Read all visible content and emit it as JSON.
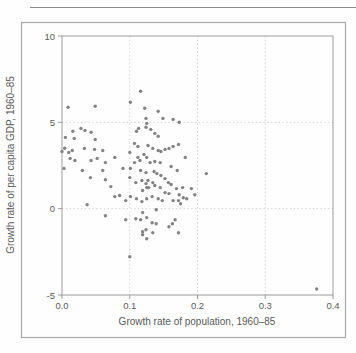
{
  "figure": {
    "background": "#fefefe",
    "box_border_color": "#a8a8a8",
    "top_rule_color": "#8c8c8c"
  },
  "chart_data": {
    "type": "scatter",
    "title": "",
    "xlabel": "Growth rate of population, 1960–85",
    "ylabel": "Growth rate of per capita GDP, 1960–85",
    "xlim": [
      0.0,
      0.4
    ],
    "ylim": [
      -5,
      10
    ],
    "grid": "dotted",
    "legend": "none",
    "x_ticks": [
      {
        "value": 0.0,
        "label": "0.0"
      },
      {
        "value": 0.1,
        "label": "0.1"
      },
      {
        "value": 0.2,
        "label": "0.2"
      },
      {
        "value": 0.3,
        "label": "0.3"
      },
      {
        "value": 0.4,
        "label": "0.4"
      }
    ],
    "y_ticks": [
      {
        "value": 10,
        "label": "10"
      },
      {
        "value": 5,
        "label": "5"
      },
      {
        "value": 0,
        "label": "0"
      },
      {
        "value": -5,
        "label": "-5"
      }
    ],
    "x_gridlines": [
      0.1,
      0.2,
      0.3
    ],
    "y_gridlines": [
      0,
      5
    ],
    "point_color": "#838383",
    "point_radius": 1.7,
    "frame_color": "#9b9b9b",
    "gridline_color": "#cbcbcb",
    "points": [
      [
        0.009,
        5.87
      ],
      [
        0.049,
        5.93
      ],
      [
        0.101,
        6.16
      ],
      [
        0.116,
        6.8
      ],
      [
        0.122,
        5.81
      ],
      [
        0.142,
        5.64
      ],
      [
        0.164,
        5.17
      ],
      [
        0.173,
        5.0
      ],
      [
        0.124,
        5.23
      ],
      [
        0.149,
        5.23
      ],
      [
        0.016,
        4.48
      ],
      [
        0.028,
        4.65
      ],
      [
        0.034,
        4.53
      ],
      [
        0.043,
        4.42
      ],
      [
        0.005,
        4.13
      ],
      [
        0.018,
        4.07
      ],
      [
        0.049,
        4.01
      ],
      [
        0.11,
        4.48
      ],
      [
        0.113,
        4.65
      ],
      [
        0.124,
        4.71
      ],
      [
        0.131,
        4.59
      ],
      [
        0.137,
        4.36
      ],
      [
        0.142,
        4.19
      ],
      [
        0.125,
        4.94
      ],
      [
        0.004,
        3.5
      ],
      [
        0.0,
        3.31
      ],
      [
        0.01,
        3.26
      ],
      [
        0.015,
        3.37
      ],
      [
        0.033,
        3.49
      ],
      [
        0.048,
        3.43
      ],
      [
        0.06,
        3.37
      ],
      [
        0.107,
        3.78
      ],
      [
        0.112,
        3.6
      ],
      [
        0.127,
        3.66
      ],
      [
        0.134,
        3.49
      ],
      [
        0.142,
        3.37
      ],
      [
        0.146,
        3.31
      ],
      [
        0.152,
        3.43
      ],
      [
        0.158,
        3.49
      ],
      [
        0.164,
        3.6
      ],
      [
        0.172,
        3.72
      ],
      [
        0.1,
        3.26
      ],
      [
        0.121,
        3.14
      ],
      [
        0.012,
        2.91
      ],
      [
        0.019,
        2.79
      ],
      [
        0.043,
        2.79
      ],
      [
        0.052,
        2.91
      ],
      [
        0.064,
        2.67
      ],
      [
        0.078,
        2.97
      ],
      [
        0.112,
        2.97
      ],
      [
        0.125,
        2.97
      ],
      [
        0.115,
        2.79
      ],
      [
        0.107,
        2.67
      ],
      [
        0.13,
        2.67
      ],
      [
        0.137,
        2.73
      ],
      [
        0.145,
        2.67
      ],
      [
        0.182,
        2.97
      ],
      [
        0.003,
        2.33
      ],
      [
        0.03,
        2.21
      ],
      [
        0.06,
        2.21
      ],
      [
        0.09,
        2.33
      ],
      [
        0.101,
        2.33
      ],
      [
        0.116,
        2.21
      ],
      [
        0.124,
        2.09
      ],
      [
        0.136,
        2.15
      ],
      [
        0.14,
        2.03
      ],
      [
        0.161,
        2.44
      ],
      [
        0.17,
        2.21
      ],
      [
        0.213,
        2.03
      ],
      [
        0.042,
        1.8
      ],
      [
        0.1,
        1.8
      ],
      [
        0.064,
        1.68
      ],
      [
        0.146,
        1.92
      ],
      [
        0.152,
        1.74
      ],
      [
        0.127,
        1.63
      ],
      [
        0.134,
        1.51
      ],
      [
        0.072,
        1.28
      ],
      [
        0.109,
        1.51
      ],
      [
        0.118,
        1.63
      ],
      [
        0.124,
        1.45
      ],
      [
        0.128,
        1.22
      ],
      [
        0.137,
        1.34
      ],
      [
        0.145,
        1.22
      ],
      [
        0.157,
        1.51
      ],
      [
        0.161,
        1.4
      ],
      [
        0.169,
        1.16
      ],
      [
        0.178,
        1.22
      ],
      [
        0.191,
        1.16
      ],
      [
        0.119,
        1.05
      ],
      [
        0.125,
        1.22
      ],
      [
        0.037,
        0.23
      ],
      [
        0.078,
        0.7
      ],
      [
        0.085,
        0.76
      ],
      [
        0.094,
        0.47
      ],
      [
        0.101,
        0.7
      ],
      [
        0.11,
        0.58
      ],
      [
        0.118,
        0.41
      ],
      [
        0.125,
        0.58
      ],
      [
        0.152,
        0.93
      ],
      [
        0.158,
        0.87
      ],
      [
        0.133,
        0.7
      ],
      [
        0.142,
        0.58
      ],
      [
        0.148,
        0.47
      ],
      [
        0.164,
        0.47
      ],
      [
        0.172,
        0.47
      ],
      [
        0.179,
        0.63
      ],
      [
        0.184,
        0.58
      ],
      [
        0.196,
        0.81
      ],
      [
        0.173,
        0.81
      ],
      [
        0.175,
        0.29
      ],
      [
        0.139,
        -0.06
      ],
      [
        0.119,
        -0.23
      ],
      [
        0.064,
        -0.41
      ],
      [
        0.094,
        -0.64
      ],
      [
        0.109,
        -0.58
      ],
      [
        0.116,
        -0.64
      ],
      [
        0.125,
        -0.52
      ],
      [
        0.167,
        -0.64
      ],
      [
        0.133,
        -0.81
      ],
      [
        0.139,
        -0.87
      ],
      [
        0.163,
        -0.87
      ],
      [
        0.158,
        -1.05
      ],
      [
        0.124,
        -1.22
      ],
      [
        0.119,
        -1.34
      ],
      [
        0.134,
        -1.4
      ],
      [
        0.172,
        -1.4
      ],
      [
        0.119,
        -1.51
      ],
      [
        0.125,
        -1.74
      ],
      [
        0.1,
        -2.79
      ],
      [
        0.376,
        -4.65
      ]
    ]
  }
}
